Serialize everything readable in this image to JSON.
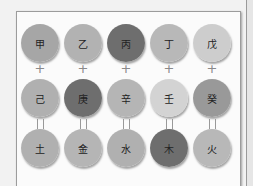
{
  "diagram": {
    "stems_row1": [
      {
        "label": "甲",
        "color": "#a6a6a6"
      },
      {
        "label": "乙",
        "color": "#b2b2b2"
      },
      {
        "label": "丙",
        "color": "#6e6e6e"
      },
      {
        "label": "丁",
        "color": "#b8b8b8"
      },
      {
        "label": "戊",
        "color": "#cdcdcd"
      }
    ],
    "operator_row1": "+",
    "stems_row2": [
      {
        "label": "己",
        "color": "#b0b0b0"
      },
      {
        "label": "庚",
        "color": "#6e6e6e"
      },
      {
        "label": "辛",
        "color": "#b5b5b5"
      },
      {
        "label": "壬",
        "color": "#d3d3d3"
      },
      {
        "label": "癸",
        "color": "#999999"
      }
    ],
    "operator_row2": "=",
    "elements_row3": [
      {
        "label": "土",
        "color": "#b0b0b0"
      },
      {
        "label": "金",
        "color": "#b5b5b5"
      },
      {
        "label": "水",
        "color": "#b0b0b0"
      },
      {
        "label": "木",
        "color": "#6e6e6e"
      },
      {
        "label": "火",
        "color": "#b8b8b8"
      }
    ]
  }
}
